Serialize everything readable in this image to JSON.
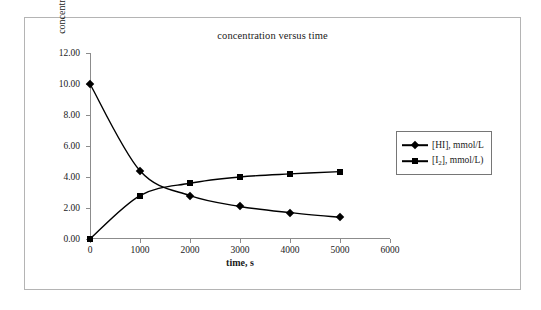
{
  "chart_data": {
    "type": "line",
    "title": "concentration versus time",
    "xlabel": "time, s",
    "ylabel": "concentration, mmol/L",
    "xlim": [
      0,
      6000
    ],
    "ylim": [
      0,
      12
    ],
    "xticks": [
      0,
      1000,
      2000,
      3000,
      4000,
      5000,
      6000
    ],
    "xtick_labels": [
      "0",
      "1000",
      "2000",
      "3000",
      "4000",
      "5000",
      "6000"
    ],
    "yticks": [
      0,
      2,
      4,
      6,
      8,
      10,
      12
    ],
    "ytick_labels": [
      "0.00",
      "2.00",
      "4.00",
      "6.00",
      "8.00",
      "10.00",
      "12.00"
    ],
    "grid": false,
    "legend_position": "right-outside",
    "x": [
      0,
      1000,
      2000,
      3000,
      4000,
      5000
    ],
    "series": [
      {
        "name": "[HI], mmol/L",
        "marker": "diamond",
        "values": [
          10.0,
          4.4,
          2.8,
          2.1,
          1.7,
          1.4
        ]
      },
      {
        "name": "[I2], mmol/L)",
        "marker": "square",
        "values": [
          0.0,
          2.8,
          3.6,
          4.0,
          4.2,
          4.35
        ]
      }
    ]
  },
  "legend": {
    "entries": [
      {
        "label_prefix": "[HI], mmol/L",
        "label_sub": "",
        "label_suffix": ""
      },
      {
        "label_prefix": "[I",
        "label_sub": "2",
        "label_suffix": "], mmol/L)"
      }
    ]
  },
  "colors": {
    "series": "#000000",
    "axis": "#8c8c8c",
    "text": "#1a1a1a",
    "frame": "#b4b4b4",
    "background": "#ffffff"
  }
}
